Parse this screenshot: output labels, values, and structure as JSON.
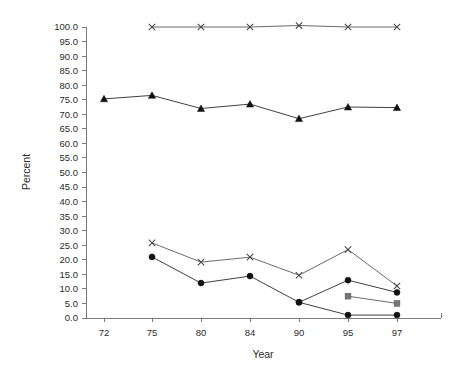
{
  "chart_data": {
    "type": "line",
    "title": "",
    "subtitle": "",
    "xlabel": "Year",
    "ylabel": "Percent",
    "categories": [
      "72",
      "75",
      "80",
      "84",
      "90",
      "95",
      "97"
    ],
    "ylim": [
      0.0,
      100.0
    ],
    "ytick_step": 5.0,
    "ytick_labels": [
      "0.0",
      "5.0",
      "10.0",
      "15.0",
      "20.0",
      "25.0",
      "30.0",
      "35.0",
      "40.0",
      "45.0",
      "50.0",
      "55.0",
      "60.0",
      "65.0",
      "70.0",
      "75.0",
      "80.0",
      "85.0",
      "90.0",
      "95.0",
      "100.0"
    ],
    "grid": false,
    "legend": "none",
    "legend_position": "none",
    "series": [
      {
        "name": "series-x-top",
        "marker": "x",
        "color": "#4a4a4a",
        "x": [
          "75",
          "80",
          "84",
          "90",
          "95",
          "97"
        ],
        "values": [
          100.0,
          100.0,
          100.0,
          100.5,
          100.0,
          100.0
        ]
      },
      {
        "name": "series-triangle",
        "marker": "triangle",
        "color": "#111111",
        "x": [
          "72",
          "75",
          "80",
          "84",
          "90",
          "95",
          "97"
        ],
        "values": [
          75.3,
          76.5,
          72.0,
          73.5,
          68.5,
          72.5,
          72.3
        ]
      },
      {
        "name": "series-x-lower",
        "marker": "x",
        "color": "#4a4a4a",
        "x": [
          "75",
          "80",
          "84",
          "90",
          "95",
          "97"
        ],
        "values": [
          25.8,
          19.2,
          20.9,
          14.7,
          23.5,
          11.0
        ]
      },
      {
        "name": "series-circle-upper",
        "marker": "circle",
        "color": "#111111",
        "x": [
          "75",
          "80",
          "84",
          "90",
          "95",
          "97"
        ],
        "values": [
          21.0,
          12.0,
          14.4,
          5.4,
          13.0,
          8.8
        ]
      },
      {
        "name": "series-circle-baseline",
        "marker": "circle",
        "color": "#111111",
        "x": [
          "90",
          "95",
          "97"
        ],
        "values": [
          5.4,
          1.0,
          1.0
        ]
      },
      {
        "name": "series-square",
        "marker": "square",
        "color": "#777777",
        "x": [
          "95",
          "97"
        ],
        "values": [
          7.5,
          5.0
        ]
      }
    ],
    "annotations": []
  },
  "geometry": {
    "plot_left": 86,
    "plot_right": 441,
    "plot_top": 27,
    "plot_bottom": 318,
    "category_x": [
      104,
      152,
      201,
      250,
      299,
      348,
      397
    ]
  }
}
